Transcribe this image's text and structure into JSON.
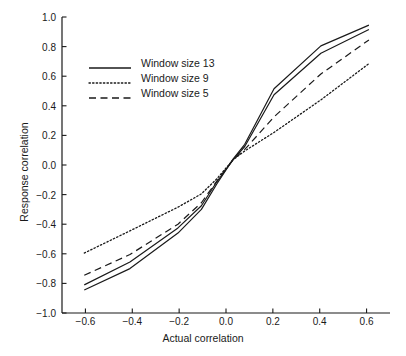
{
  "chart_data": {
    "type": "line",
    "title": "",
    "subtitle": "",
    "xlabel": "Actual correlation",
    "ylabel": "Response correlation",
    "xlim": [
      -0.7,
      0.7
    ],
    "ylim": [
      -1.0,
      1.0
    ],
    "xticks": [
      -0.6,
      -0.4,
      -0.2,
      0.0,
      0.2,
      0.4,
      0.6
    ],
    "yticks": [
      -1.0,
      -0.8,
      -0.6,
      -0.4,
      -0.2,
      0.0,
      0.2,
      0.4,
      0.6,
      0.8,
      1.0
    ],
    "xticklabels": [
      "−0.6",
      "−0.4",
      "−0.2",
      "0.0",
      "0.2",
      "0.4",
      "0.6"
    ],
    "yticklabels": [
      "−1.0",
      "−0.8",
      "−0.6",
      "−0.4",
      "−0.2",
      "0.0",
      "0.2",
      "0.4",
      "0.6",
      "0.8",
      "1.0"
    ],
    "grid": false,
    "legend_position": "upper left",
    "line_color": "#1a1a1a",
    "series": [
      {
        "name": "Window size 13",
        "style": "solid",
        "x": [
          -0.605,
          -0.41,
          -0.205,
          -0.105,
          -0.04,
          0.03,
          0.08,
          0.205,
          0.405,
          0.61
        ],
        "values": [
          -0.845,
          -0.7,
          -0.46,
          -0.3,
          -0.13,
          0.04,
          0.14,
          0.515,
          0.805,
          0.945
        ]
      },
      {
        "name": "Window size 13 (second trace)",
        "style": "solid",
        "x": [
          -0.605,
          -0.41,
          -0.205,
          -0.105,
          -0.04,
          0.03,
          0.08,
          0.205,
          0.405,
          0.61
        ],
        "values": [
          -0.81,
          -0.655,
          -0.425,
          -0.275,
          -0.115,
          0.035,
          0.125,
          0.475,
          0.755,
          0.915
        ]
      },
      {
        "name": "Window size 5",
        "style": "dashed",
        "x": [
          -0.605,
          -0.41,
          -0.205,
          -0.105,
          -0.04,
          0.03,
          0.08,
          0.205,
          0.405,
          0.61
        ],
        "values": [
          -0.745,
          -0.605,
          -0.4,
          -0.255,
          -0.11,
          0.035,
          0.105,
          0.325,
          0.615,
          0.845
        ]
      },
      {
        "name": "Window size 9",
        "style": "dotted",
        "x": [
          -0.605,
          -0.41,
          -0.205,
          -0.105,
          -0.04,
          0.03,
          0.08,
          0.205,
          0.405,
          0.61
        ],
        "values": [
          -0.595,
          -0.445,
          -0.285,
          -0.195,
          -0.095,
          0.035,
          0.095,
          0.22,
          0.44,
          0.685
        ]
      }
    ]
  },
  "legend": {
    "entries": [
      {
        "label": "Window size 13",
        "style": "solid"
      },
      {
        "label": "Window size 9",
        "style": "dotted"
      },
      {
        "label": "Window size 5",
        "style": "dashed"
      }
    ]
  },
  "axes": {
    "x_title": "Actual correlation",
    "y_title": "Response correlation"
  }
}
